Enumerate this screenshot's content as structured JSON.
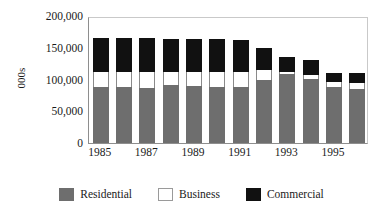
{
  "chart_data": {
    "type": "bar",
    "subtype": "stacked-vertical",
    "title": "",
    "subtitle": "",
    "xlabel": "",
    "ylabel": "000s",
    "ylim": [
      0,
      200000
    ],
    "ytick_values": [
      0,
      50000,
      100000,
      150000,
      200000
    ],
    "ytick_labels": [
      "0",
      "50,000",
      "100,000",
      "150,000",
      "200,000"
    ],
    "grid": false,
    "legend_position": "bottom",
    "categories": [
      "1985",
      "1986",
      "1987",
      "1988",
      "1989",
      "1990",
      "1991",
      "1992",
      "1993",
      "1994",
      "1995",
      "1996"
    ],
    "xtick_labels": [
      "1985",
      "",
      "1987",
      "",
      "1989",
      "",
      "1991",
      "",
      "1993",
      "",
      "1995",
      ""
    ],
    "xtick_labels_shown": [
      "1985",
      "1987",
      "1989",
      "1991",
      "1993",
      "1995"
    ],
    "series": [
      {
        "name": "Residential",
        "color": "#6e6e6e",
        "values": [
          88000,
          88000,
          87000,
          91000,
          90000,
          89000,
          89000,
          100000,
          108000,
          101000,
          88000,
          85000
        ]
      },
      {
        "name": "Business",
        "color": "#ffffff",
        "values": [
          24000,
          24000,
          25000,
          21000,
          22000,
          23000,
          23000,
          15000,
          4000,
          6000,
          8000,
          10000
        ]
      },
      {
        "name": "Commercial",
        "color": "#111111",
        "values": [
          53000,
          53000,
          53000,
          52000,
          52000,
          52000,
          50000,
          34000,
          23000,
          23000,
          15000,
          16000
        ]
      }
    ],
    "totals": [
      165000,
      165000,
      165000,
      164000,
      164000,
      164000,
      162000,
      149000,
      135000,
      130000,
      111000,
      111000
    ]
  },
  "axes": {
    "y_title": "000s"
  },
  "legend": {
    "items": [
      {
        "label": "Residential",
        "swatch": "gray-swatch-icon"
      },
      {
        "label": "Business",
        "swatch": "white-swatch-icon"
      },
      {
        "label": "Commercial",
        "swatch": "black-swatch-icon"
      }
    ]
  },
  "colors": {
    "residential": "#6e6e6e",
    "business": "#ffffff",
    "commercial": "#111111",
    "axis": "#8e8e8e",
    "text": "#1a1a1a"
  }
}
